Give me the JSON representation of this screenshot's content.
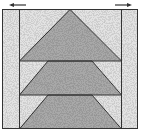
{
  "diagram": {
    "type": "quilt-block",
    "colors": {
      "background": "#ffffff",
      "light_fill": "#e2e2e2",
      "dark_fill": "#a8a8a8",
      "stroke": "#333333",
      "arrow": "#333333"
    },
    "arrows": [
      {
        "direction": "left",
        "position": "top-left"
      },
      {
        "direction": "right",
        "position": "top-right"
      }
    ],
    "rows": 3,
    "side_strips": 2
  }
}
